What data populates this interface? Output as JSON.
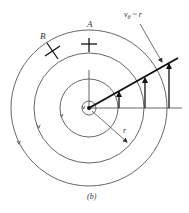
{
  "diagram": {
    "type": "free-vortex-streamlines",
    "caption": "(b)",
    "center": {
      "x": 89,
      "y": 108
    },
    "circles": [
      {
        "name": "core",
        "r": 7
      },
      {
        "name": "inner",
        "r": 29
      },
      {
        "name": "middle",
        "r": 55
      },
      {
        "name": "outer",
        "r": 78
      }
    ],
    "labels": {
      "point_a": "A",
      "point_b": "B",
      "velocity_law_symbol": "v",
      "velocity_law_subscript": "θ",
      "velocity_law_rest": " ~ r",
      "radius": "r"
    },
    "velocity_arrows_x": [
      119,
      145,
      169
    ],
    "colors": {
      "line": "#555555",
      "bold_line": "#111111",
      "text": "#333333",
      "background": "#ffffff"
    }
  }
}
